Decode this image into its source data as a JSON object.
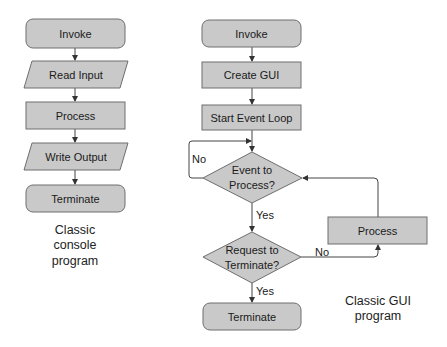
{
  "colors": {
    "shape_fill": "#c9c9c9",
    "shape_stroke": "#6e6e6e",
    "line": "#444444",
    "background": "#ffffff"
  },
  "console_flow": {
    "caption": [
      "Classic",
      "console",
      "program"
    ],
    "nodes": [
      {
        "id": "invoke",
        "shape": "terminator",
        "label": "Invoke"
      },
      {
        "id": "read-input",
        "shape": "io",
        "label": "Read Input"
      },
      {
        "id": "process",
        "shape": "process",
        "label": "Process"
      },
      {
        "id": "write-output",
        "shape": "io",
        "label": "Write Output"
      },
      {
        "id": "terminate",
        "shape": "terminator",
        "label": "Terminate"
      }
    ]
  },
  "gui_flow": {
    "caption": [
      "Classic GUI",
      "program"
    ],
    "nodes": [
      {
        "id": "invoke",
        "shape": "terminator",
        "label": "Invoke"
      },
      {
        "id": "create-gui",
        "shape": "process",
        "label": "Create GUI"
      },
      {
        "id": "start-event-loop",
        "shape": "process",
        "label": "Start Event Loop"
      },
      {
        "id": "event-decision",
        "shape": "decision",
        "label": [
          "Event to",
          "Process?"
        ]
      },
      {
        "id": "terminate-decision",
        "shape": "decision",
        "label": [
          "Request to",
          "Terminate?"
        ]
      },
      {
        "id": "process",
        "shape": "process",
        "label": "Process"
      },
      {
        "id": "terminate",
        "shape": "terminator",
        "label": "Terminate"
      }
    ],
    "edge_labels": {
      "event_no": "No",
      "event_yes": "Yes",
      "terminate_no": "No",
      "terminate_yes": "Yes"
    }
  }
}
